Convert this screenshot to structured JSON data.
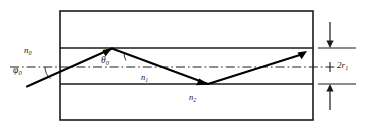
{
  "figure": {
    "colors": {
      "stroke": "#1a1a1a",
      "ray": "#000000",
      "background": "#ffffff"
    },
    "labels": {
      "n0": {
        "base": "n",
        "sub": "0",
        "name": "refractive-index-n0"
      },
      "phi0": {
        "base": "φ",
        "sub": "0",
        "name": "incidence-angle-phi0"
      },
      "theta0": {
        "base": "θ",
        "sub": "0",
        "name": "refraction-angle-theta0"
      },
      "n1": {
        "base": "n",
        "sub": "1",
        "name": "refractive-index-n1"
      },
      "n2": {
        "base": "n",
        "sub": "2",
        "name": "refractive-index-n2"
      },
      "core_diameter": {
        "base": "2r",
        "sub": "1",
        "name": "core-diameter-2r1"
      }
    },
    "geometry": {
      "outer_box": {
        "x": 60,
        "y": 11,
        "width": 253,
        "height": 109
      },
      "core_top_line_y": 48,
      "core_bottom_line_y": 84,
      "axis_y": 67,
      "axis_x_start": 10,
      "axis_x_end": 336,
      "dimension_line_x": 330,
      "ray_points": [
        {
          "x": 27,
          "y": 86
        },
        {
          "x": 112,
          "y": 48
        },
        {
          "x": 208,
          "y": 84
        },
        {
          "x": 307,
          "y": 52
        }
      ],
      "arc_phi0_center": {
        "x": 60,
        "y": 67
      },
      "arc_theta0_center": {
        "x": 112,
        "y": 48
      }
    }
  }
}
